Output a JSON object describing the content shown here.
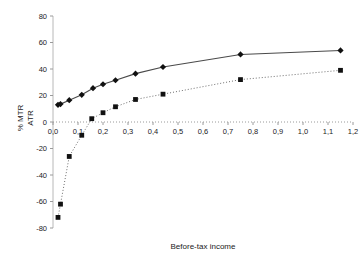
{
  "chart_data": {
    "type": "line",
    "title": "",
    "xlabel": "Before-tax income",
    "ylabel": "% MTR\nATR",
    "ylabel_lines": [
      "% MTR",
      "ATR"
    ],
    "xlim": [
      0.0,
      1.2
    ],
    "ylim": [
      -80,
      80
    ],
    "grid": false,
    "legend": "none",
    "x_tick_labels": [
      "0,0",
      "0,1",
      "0,2",
      "0,3",
      "0,4",
      "0,5",
      "0,6",
      "0,7",
      "0,8",
      "0,9",
      "1,0",
      "1,1",
      "1,2"
    ],
    "x_tick_values": [
      0.0,
      0.1,
      0.2,
      0.3,
      0.4,
      0.5,
      0.6,
      0.7,
      0.8,
      0.9,
      1.0,
      1.1,
      1.2
    ],
    "y_tick_labels": [
      "80",
      "60",
      "40",
      "20",
      "0",
      "-20",
      "-40",
      "-60",
      "-80"
    ],
    "y_tick_values": [
      80,
      60,
      40,
      20,
      0,
      -20,
      -40,
      -60,
      -80
    ],
    "series": [
      {
        "name": "MTR",
        "marker": "diamond",
        "line_style": "solid",
        "color": "#4a4a4a",
        "points": [
          {
            "x": 0.02,
            "y": 13.0
          },
          {
            "x": 0.03,
            "y": 13.5
          },
          {
            "x": 0.065,
            "y": 16.5
          },
          {
            "x": 0.115,
            "y": 20.5
          },
          {
            "x": 0.16,
            "y": 25.5
          },
          {
            "x": 0.2,
            "y": 28.5
          },
          {
            "x": 0.25,
            "y": 31.5
          },
          {
            "x": 0.33,
            "y": 36.5
          },
          {
            "x": 0.44,
            "y": 41.5
          },
          {
            "x": 0.75,
            "y": 51.0
          },
          {
            "x": 1.15,
            "y": 54.0
          }
        ]
      },
      {
        "name": "ATR",
        "marker": "square",
        "line_style": "dotted",
        "color": "#6e6e6e",
        "points": [
          {
            "x": 0.02,
            "y": -72.0
          },
          {
            "x": 0.03,
            "y": -62.0
          },
          {
            "x": 0.065,
            "y": -26.0
          },
          {
            "x": 0.115,
            "y": -10.0
          },
          {
            "x": 0.155,
            "y": 2.5
          },
          {
            "x": 0.2,
            "y": 7.0
          },
          {
            "x": 0.25,
            "y": 11.5
          },
          {
            "x": 0.33,
            "y": 17.0
          },
          {
            "x": 0.44,
            "y": 21.0
          },
          {
            "x": 0.75,
            "y": 32.0
          },
          {
            "x": 1.15,
            "y": 39.0
          }
        ]
      }
    ]
  }
}
